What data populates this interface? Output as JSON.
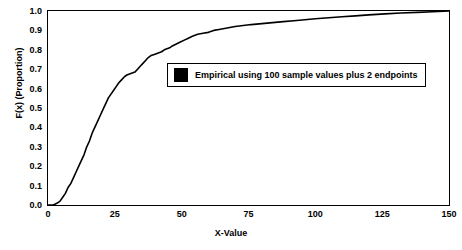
{
  "chart_data": {
    "type": "line",
    "title": "",
    "xlabel": "X-Value",
    "ylabel": "F(x) (Proportion)",
    "xlim": [
      0,
      150
    ],
    "ylim": [
      0,
      1.0
    ],
    "grid": false,
    "legend_position": "inside-upper-middle",
    "xticks": [
      0,
      25,
      50,
      75,
      100,
      125,
      150
    ],
    "xtick_labels": [
      "0",
      "25",
      "50",
      "75",
      "100",
      "125",
      "150"
    ],
    "yticks": [
      0.0,
      0.1,
      0.2,
      0.3,
      0.4,
      0.5,
      0.6,
      0.7,
      0.8,
      0.9,
      1.0
    ],
    "ytick_labels": [
      "0.0",
      "0.1",
      "0.2",
      "0.3",
      "0.4",
      "0.5",
      "0.6",
      "0.7",
      "0.8",
      "0.9",
      "1.0"
    ],
    "series": [
      {
        "name": "Empirical using 100 sample values plus 2 endpoints",
        "color": "#000000",
        "x": [
          0,
          2,
          3.5,
          4.5,
          5.5,
          6.5,
          7.5,
          8.5,
          9.5,
          10.5,
          11.5,
          12.5,
          13.5,
          14.5,
          15.5,
          16.5,
          17.5,
          18.5,
          19.5,
          20.5,
          21.5,
          22.5,
          23.5,
          24.5,
          25.5,
          26.5,
          27.5,
          28.5,
          29.5,
          30.5,
          31.5,
          32.5,
          33.5,
          34.5,
          35.5,
          36.5,
          37.5,
          38.5,
          39.5,
          40.5,
          41.5,
          42.5,
          43.5,
          44.5,
          45.5,
          46.5,
          48,
          49.5,
          51,
          52.5,
          54,
          56,
          58,
          60,
          62,
          64,
          66,
          68,
          70,
          73,
          76,
          80,
          84,
          88,
          92,
          96,
          100,
          105,
          110,
          115,
          120,
          126,
          132,
          138,
          144,
          150
        ],
        "y": [
          0.0,
          0.0,
          0.01,
          0.02,
          0.04,
          0.06,
          0.09,
          0.11,
          0.14,
          0.17,
          0.2,
          0.23,
          0.26,
          0.3,
          0.33,
          0.37,
          0.4,
          0.43,
          0.46,
          0.49,
          0.52,
          0.55,
          0.57,
          0.59,
          0.61,
          0.63,
          0.645,
          0.66,
          0.67,
          0.675,
          0.68,
          0.685,
          0.7,
          0.715,
          0.73,
          0.745,
          0.76,
          0.77,
          0.775,
          0.78,
          0.785,
          0.79,
          0.8,
          0.805,
          0.81,
          0.82,
          0.83,
          0.84,
          0.85,
          0.86,
          0.87,
          0.88,
          0.885,
          0.89,
          0.9,
          0.905,
          0.91,
          0.915,
          0.92,
          0.925,
          0.93,
          0.935,
          0.94,
          0.945,
          0.95,
          0.955,
          0.96,
          0.965,
          0.97,
          0.975,
          0.98,
          0.985,
          0.99,
          0.993,
          0.996,
          1.0
        ]
      }
    ],
    "legend": [
      {
        "label": "Empirical using 100 sample values plus 2 endpoints",
        "swatch": "#000000",
        "marker": "filled-square"
      }
    ]
  }
}
